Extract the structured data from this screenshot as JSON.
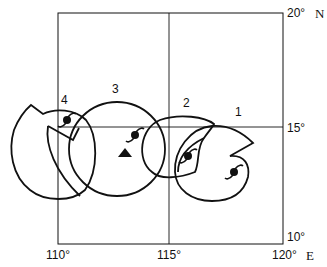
{
  "diagram": {
    "type": "typhoon-track-map",
    "axes": {
      "longitude_labels": [
        "110°",
        "115°",
        "120°"
      ],
      "longitude_unit": "E",
      "latitude_labels": [
        "20°",
        "15°",
        "10°"
      ],
      "latitude_unit": "N"
    },
    "positions": [
      {
        "label": "1",
        "icon": "typhoon-icon"
      },
      {
        "label": "2",
        "icon": "typhoon-icon"
      },
      {
        "label": "3",
        "icon": "typhoon-icon"
      },
      {
        "label": "4",
        "icon": "typhoon-icon"
      }
    ],
    "marker": {
      "icon": "triangle-marker-icon"
    },
    "colors": {
      "line": "#111111",
      "background": "#ffffff"
    }
  }
}
